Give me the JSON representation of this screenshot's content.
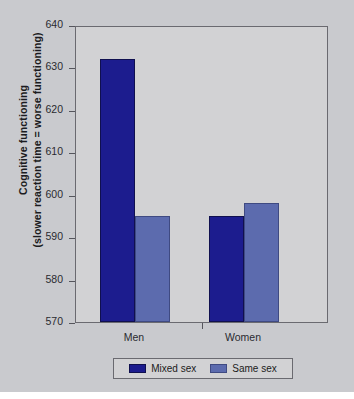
{
  "chart_data": {
    "type": "bar",
    "title": "",
    "xlabel": "",
    "ylabel": "Cognitive functioning (slower reaction time = worse functioning)",
    "ylabel_lines": [
      "Cognitive functioning",
      "(slower reaction time = worse functioning)"
    ],
    "categories": [
      "Men",
      "Women"
    ],
    "series": [
      {
        "name": "Mixed sex",
        "values": [
          632,
          595
        ],
        "color": "#1c1c8e"
      },
      {
        "name": "Same sex",
        "values": [
          595,
          598
        ],
        "color": "#5c6bae"
      }
    ],
    "ylim": [
      570,
      640
    ],
    "yticks": [
      640,
      630,
      620,
      610,
      600,
      590,
      580,
      570
    ],
    "ytick_labels": [
      "640",
      "630",
      "620",
      "610",
      "600",
      "590",
      "580",
      "570"
    ],
    "grid": false,
    "legend_position": "bottom",
    "legend_entries": [
      "Mixed sex",
      "Same sex"
    ],
    "colors": {
      "mixed_sex": "#1c1c8e",
      "same_sex": "#5c6bae",
      "figure_background": "#c9cace",
      "plot_background": "#d2d2d4",
      "axis": "#55555c"
    }
  }
}
